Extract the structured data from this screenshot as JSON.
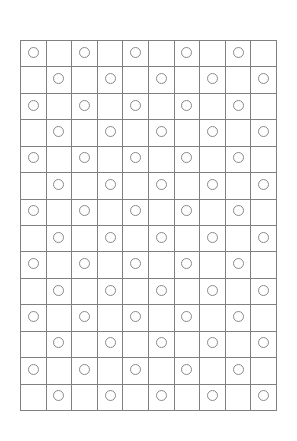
{
  "page": {
    "background_color": "#ffffff"
  },
  "grid": {
    "columns": 10,
    "rows": 14,
    "line_color": "#808080",
    "cell_fill": "#ffffff",
    "marker": {
      "shape": "circle",
      "name": "circle-marker",
      "stroke_color": "#8a8a8a",
      "fill": "none",
      "diameter_px": 11
    },
    "pattern": "checkerboard",
    "cells": [
      [
        1,
        0,
        1,
        0,
        1,
        0,
        1,
        0,
        1,
        0
      ],
      [
        0,
        1,
        0,
        1,
        0,
        1,
        0,
        1,
        0,
        1
      ],
      [
        1,
        0,
        1,
        0,
        1,
        0,
        1,
        0,
        1,
        0
      ],
      [
        0,
        1,
        0,
        1,
        0,
        1,
        0,
        1,
        0,
        1
      ],
      [
        1,
        0,
        1,
        0,
        1,
        0,
        1,
        0,
        1,
        0
      ],
      [
        0,
        1,
        0,
        1,
        0,
        1,
        0,
        1,
        0,
        1
      ],
      [
        1,
        0,
        1,
        0,
        1,
        0,
        1,
        0,
        1,
        0
      ],
      [
        0,
        1,
        0,
        1,
        0,
        1,
        0,
        1,
        0,
        1
      ],
      [
        1,
        0,
        1,
        0,
        1,
        0,
        1,
        0,
        1,
        0
      ],
      [
        0,
        1,
        0,
        1,
        0,
        1,
        0,
        1,
        0,
        1
      ],
      [
        1,
        0,
        1,
        0,
        1,
        0,
        1,
        0,
        1,
        0
      ],
      [
        0,
        1,
        0,
        1,
        0,
        1,
        0,
        1,
        0,
        1
      ],
      [
        1,
        0,
        1,
        0,
        1,
        0,
        1,
        0,
        1,
        0
      ],
      [
        0,
        1,
        0,
        1,
        0,
        1,
        0,
        1,
        0,
        1
      ]
    ]
  }
}
